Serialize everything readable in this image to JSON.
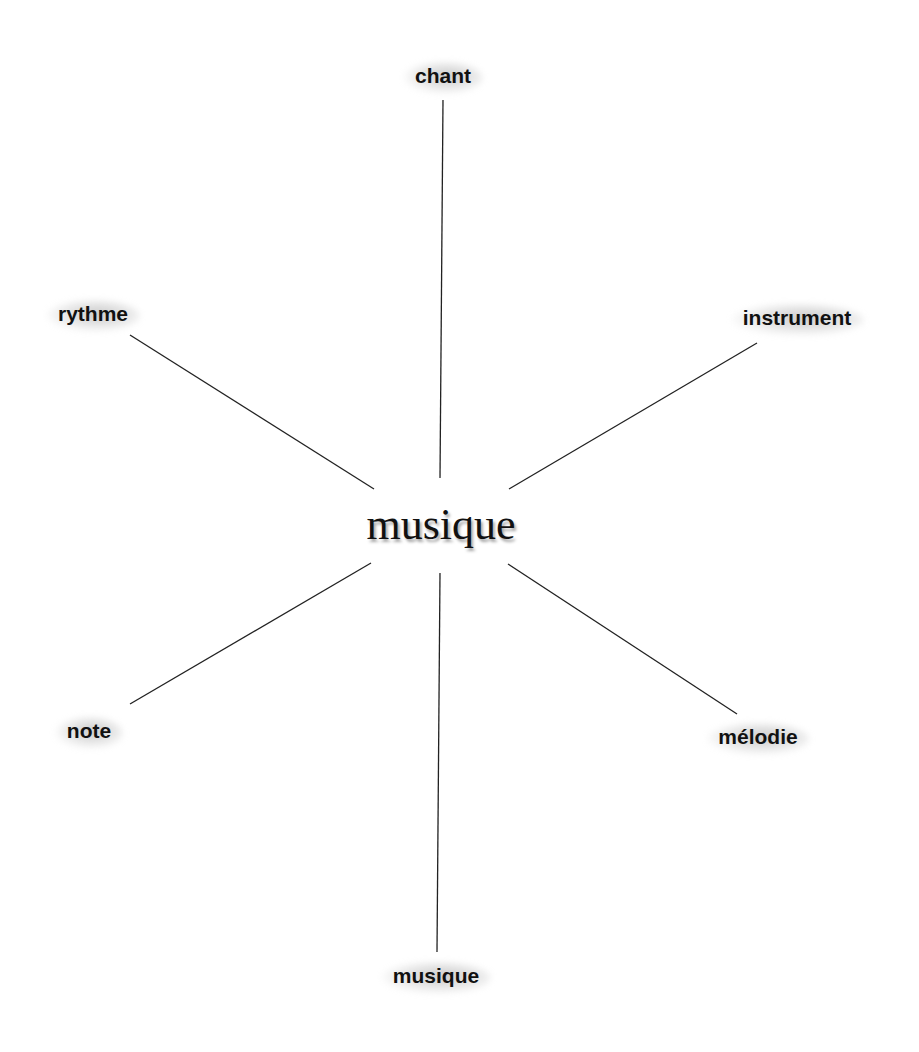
{
  "diagram": {
    "type": "word-web",
    "center": {
      "label": "musique",
      "x": 441,
      "y": 524
    },
    "line_color": "#222222",
    "nodes": [
      {
        "id": "chant",
        "label": "chant",
        "x": 443,
        "y": 76,
        "line": [
          443,
          100,
          440,
          478
        ]
      },
      {
        "id": "rythme",
        "label": "rythme",
        "x": 93,
        "y": 314,
        "line": [
          130,
          335,
          374,
          489
        ]
      },
      {
        "id": "instrument",
        "label": "instrument",
        "x": 797,
        "y": 318,
        "line": [
          757,
          343,
          509,
          489
        ]
      },
      {
        "id": "note",
        "label": "note",
        "x": 89,
        "y": 731,
        "line": [
          130,
          704,
          371,
          563
        ]
      },
      {
        "id": "melodie",
        "label": "mélodie",
        "x": 758,
        "y": 737,
        "line": [
          737,
          714,
          508,
          564
        ]
      },
      {
        "id": "musique",
        "label": "musique",
        "x": 436,
        "y": 976,
        "line": [
          440,
          573,
          437,
          952
        ]
      }
    ]
  }
}
